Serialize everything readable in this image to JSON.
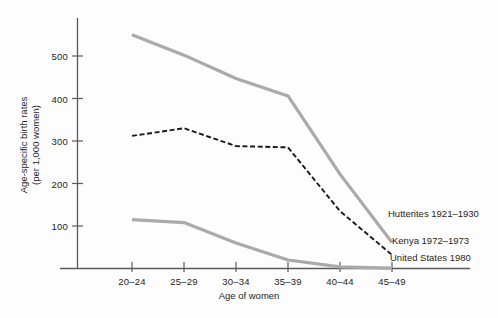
{
  "chart_data": {
    "type": "line",
    "title": "",
    "xlabel": "Age of women",
    "ylabel": "Age-specific birth rates (per 1,000 women)",
    "ylabel_line1": "Age-specific birth rates",
    "ylabel_line2": "(per 1,000 women)",
    "categories": [
      "20-24",
      "25-29",
      "30-34",
      "35-39",
      "40-44",
      "45-49"
    ],
    "xtick_labels": [
      "20–24",
      "25–29",
      "30–34",
      "35–39",
      "40–44",
      "45–49"
    ],
    "ytick_values": [
      100,
      200,
      300,
      400,
      500
    ],
    "ytick_labels": [
      "100",
      "200",
      "300",
      "400",
      "500"
    ],
    "ylim": [
      0,
      560
    ],
    "grid": false,
    "legend_position": "inline-right",
    "series": [
      {
        "name": "Hutterites 1921–1930",
        "label": "Hutterites 1921–1930",
        "style": "solid",
        "color": "#aaaaaa",
        "values": [
          550,
          502,
          447,
          406,
          222,
          61
        ]
      },
      {
        "name": "Kenya 1972–1973",
        "label": "Kenya 1972–1973",
        "style": "dashed",
        "color": "#1a1a1a",
        "values": [
          312,
          330,
          288,
          285,
          135,
          32
        ]
      },
      {
        "name": "United States 1980",
        "label": "United States 1980",
        "style": "solid",
        "color": "#aaaaaa",
        "values": [
          115,
          108,
          60,
          20,
          4,
          1
        ]
      }
    ]
  },
  "axes": {
    "yaxis_name": "y-axis",
    "xaxis_name": "x-axis"
  },
  "colors": {
    "gray_series": "#aaaaaa",
    "dark_series": "#1a1a1a",
    "axis": "#5a5a5a",
    "text": "#1d1d1d",
    "background": "#fdfdfd"
  }
}
